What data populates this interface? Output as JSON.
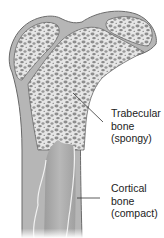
{
  "diagram": {
    "labels": [
      {
        "id": "trabecular",
        "lines": [
          "Trabecular",
          "bone",
          "(spongy)"
        ]
      },
      {
        "id": "cortical",
        "lines": [
          "Cortical",
          "bone",
          "(compact)"
        ]
      }
    ],
    "colors": {
      "cortical": "#b4b4b4",
      "trabecular_bg": "#e4e4e4",
      "trabecular_pores": "#8e8e8e",
      "outline": "#6a6a6a",
      "marrow": "#a8a8a8",
      "leader": "#333333"
    }
  }
}
